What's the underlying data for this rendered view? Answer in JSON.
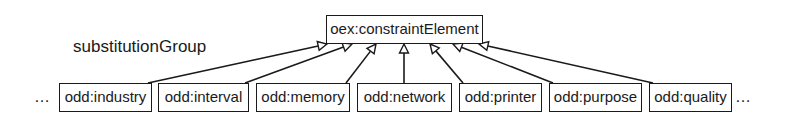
{
  "diagram": {
    "parent": {
      "label": "oex:constraintElement",
      "x": 326,
      "y": 15,
      "w": 157,
      "h": 29
    },
    "relation_label": "substitutionGroup",
    "ellipsis_left": "…",
    "ellipsis_right": "…",
    "children": [
      {
        "label": "odd:industry",
        "x": 59,
        "w": 93,
        "target_x": 327
      },
      {
        "label": "odd:interval",
        "x": 158,
        "w": 91,
        "target_x": 352
      },
      {
        "label": "odd:memory",
        "x": 256,
        "w": 94,
        "target_x": 376
      },
      {
        "label": "odd:network",
        "x": 357,
        "w": 95,
        "target_x": 404
      },
      {
        "label": "odd:printer",
        "x": 459,
        "w": 83,
        "target_x": 430
      },
      {
        "label": "odd:purpose",
        "x": 549,
        "w": 93,
        "target_x": 453
      },
      {
        "label": "odd:quality",
        "x": 649,
        "w": 83,
        "target_x": 479
      }
    ],
    "child_y": 83,
    "child_h": 29,
    "line_color": "#1a1a1a"
  }
}
